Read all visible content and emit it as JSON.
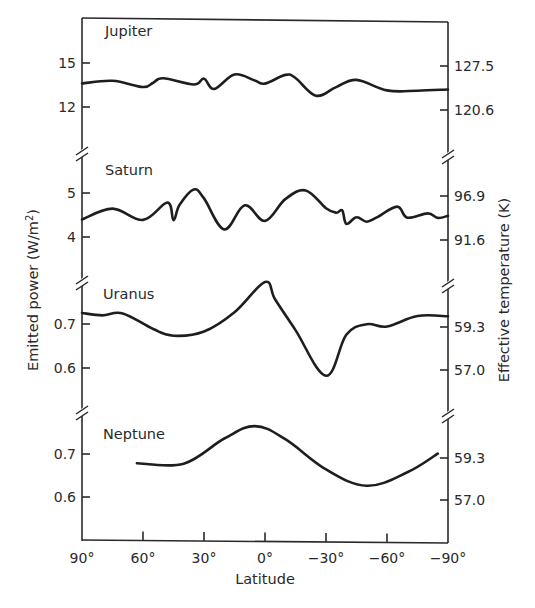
{
  "chart_data": {
    "type": "line",
    "title": "",
    "xlabel": "Latitude",
    "ylabel_left": "Emitted power (W/m²)",
    "ylabel_right": "Effective temperature (K)",
    "x_ticks": [
      "90°",
      "60°",
      "30°",
      "0°",
      "−30°",
      "−60°",
      "−90°"
    ],
    "x_tick_values": [
      90,
      60,
      30,
      0,
      -30,
      -60,
      -90
    ],
    "xlim": [
      90,
      -90
    ],
    "grid": false,
    "legend": "none (panels labeled in-plot)",
    "panels": [
      {
        "name": "Jupiter",
        "left_ticks": [
          {
            "label": "15",
            "value": 15
          },
          {
            "label": "12",
            "value": 12
          }
        ],
        "right_ticks": [
          {
            "label": "127.5"
          },
          {
            "label": "120.6"
          }
        ],
        "x": [
          90,
          75,
          60,
          55,
          50,
          35,
          30,
          25,
          15,
          5,
          0,
          -10,
          -15,
          -25,
          -35,
          -45,
          -60,
          -75,
          -90
        ],
        "values": [
          13.6,
          13.8,
          13.4,
          13.7,
          14.0,
          13.6,
          14.0,
          13.3,
          14.3,
          13.9,
          13.7,
          14.3,
          14.1,
          12.9,
          13.5,
          14.0,
          13.3,
          13.3,
          13.4
        ]
      },
      {
        "name": "Saturn",
        "left_ticks": [
          {
            "label": "5",
            "value": 5
          },
          {
            "label": "4",
            "value": 4
          }
        ],
        "right_ticks": [
          {
            "label": "96.9"
          },
          {
            "label": "91.6"
          }
        ],
        "x": [
          90,
          75,
          60,
          48,
          45,
          42,
          35,
          30,
          20,
          10,
          0,
          -10,
          -20,
          -30,
          -35,
          -38,
          -40,
          -45,
          -50,
          -55,
          -65,
          -70,
          -80,
          -85,
          -90
        ],
        "values": [
          4.4,
          4.65,
          4.4,
          4.8,
          4.4,
          4.75,
          5.1,
          4.9,
          4.2,
          4.75,
          4.4,
          4.9,
          5.1,
          4.7,
          4.6,
          4.65,
          4.35,
          4.5,
          4.4,
          4.5,
          4.75,
          4.5,
          4.6,
          4.5,
          4.55
        ]
      },
      {
        "name": "Uranus",
        "left_ticks": [
          {
            "label": "0.7",
            "value": 0.7
          },
          {
            "label": "0.6",
            "value": 0.6
          }
        ],
        "right_ticks": [
          {
            "label": "59.3"
          },
          {
            "label": "57.0"
          }
        ],
        "x": [
          90,
          80,
          70,
          55,
          45,
          30,
          15,
          0,
          -5,
          -15,
          -30,
          -40,
          -50,
          -60,
          -75,
          -90
        ],
        "values": [
          0.725,
          0.72,
          0.725,
          0.69,
          0.675,
          0.685,
          0.73,
          0.8,
          0.76,
          0.69,
          0.585,
          0.68,
          0.705,
          0.7,
          0.725,
          0.725
        ]
      },
      {
        "name": "Neptune",
        "left_ticks": [
          {
            "label": "0.7",
            "value": 0.7
          },
          {
            "label": "0.6",
            "value": 0.6
          }
        ],
        "right_ticks": [
          {
            "label": "59.3"
          },
          {
            "label": "57.0"
          }
        ],
        "x": [
          63,
          40,
          20,
          5,
          -10,
          -30,
          -50,
          -70,
          -85
        ],
        "values": [
          0.68,
          0.68,
          0.74,
          0.77,
          0.74,
          0.67,
          0.632,
          0.665,
          0.71
        ]
      }
    ]
  },
  "labels": {
    "x_axis_title": "Latitude",
    "left_axis_title": "Emitted power (W/m²)",
    "right_axis_title": "Effective temperature (K)"
  }
}
